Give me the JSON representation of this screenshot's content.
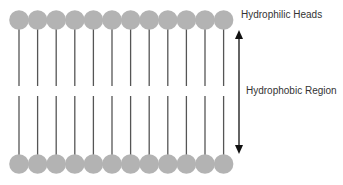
{
  "diagram": {
    "labels": {
      "heads": "Hydrophilic Heads",
      "region": "Hydrophobic Region"
    },
    "head_count_per_row": 12,
    "colors": {
      "head": "#b3b3b3",
      "tail": "#555555",
      "arrow": "#111111",
      "text": "#333333"
    }
  }
}
